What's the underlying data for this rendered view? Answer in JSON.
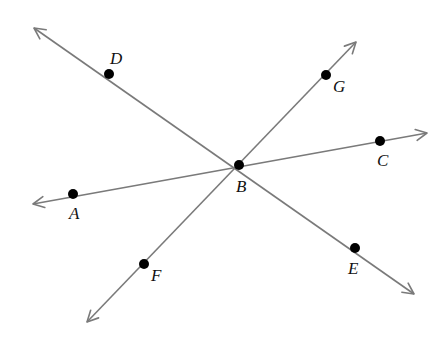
{
  "diagram": {
    "type": "intersecting-lines",
    "colors": {
      "line": "#7a7a7a",
      "point": "#000000",
      "label": "#111111",
      "background": "#ffffff"
    },
    "intersection": {
      "name": "B",
      "x": 239,
      "y": 165,
      "label_x": 236,
      "label_y": 192
    },
    "lines": [
      {
        "name": "line-DE",
        "start": {
          "x": 34,
          "y": 28
        },
        "end": {
          "x": 414,
          "y": 294
        },
        "points": [
          "D",
          "B",
          "E"
        ]
      },
      {
        "name": "line-FG",
        "start": {
          "x": 87,
          "y": 322
        },
        "end": {
          "x": 356,
          "y": 42
        },
        "points": [
          "F",
          "B",
          "G"
        ]
      },
      {
        "name": "line-AC",
        "start": {
          "x": 33,
          "y": 204
        },
        "end": {
          "x": 427,
          "y": 133
        },
        "points": [
          "A",
          "B",
          "C"
        ]
      }
    ],
    "points": [
      {
        "name": "D",
        "x": 109,
        "y": 74,
        "label_x": 110,
        "label_y": 64
      },
      {
        "name": "G",
        "x": 326,
        "y": 75,
        "label_x": 333,
        "label_y": 92
      },
      {
        "name": "C",
        "x": 380,
        "y": 141,
        "label_x": 377,
        "label_y": 166
      },
      {
        "name": "B",
        "x": 239,
        "y": 165,
        "label_x": 236,
        "label_y": 192
      },
      {
        "name": "A",
        "x": 73,
        "y": 194,
        "label_x": 69,
        "label_y": 219
      },
      {
        "name": "F",
        "x": 144,
        "y": 264,
        "label_x": 151,
        "label_y": 281
      },
      {
        "name": "E",
        "x": 355,
        "y": 248,
        "label_x": 348,
        "label_y": 274
      }
    ]
  }
}
